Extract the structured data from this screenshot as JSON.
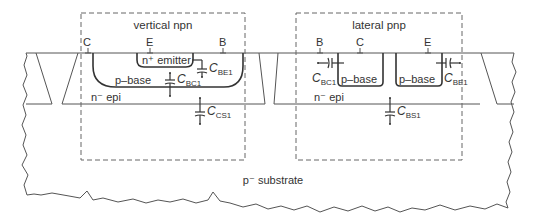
{
  "diagram": {
    "colors": {
      "line": "#555555",
      "junction": "#333333",
      "dash": "#666666",
      "text": "#333333",
      "background": "#ffffff"
    },
    "regions": {
      "substrate": "p⁻ substrate",
      "npn_epi": "n⁻ epi",
      "pnp_epi": "n⁻ epi"
    },
    "vertical_npn": {
      "box_label": "vertical npn",
      "terminals": {
        "collector": "C",
        "emitter": "E",
        "base": "B"
      },
      "emitter_region": "n⁺ emitter",
      "base_region": "p–base",
      "capacitors": [
        {
          "id": "cbe1",
          "symbol": "C",
          "subscript": "BE1"
        },
        {
          "id": "cbc1",
          "symbol": "C",
          "subscript": "BC1"
        },
        {
          "id": "ccs1",
          "symbol": "C",
          "subscript": "CS1"
        }
      ]
    },
    "lateral_pnp": {
      "box_label": "lateral pnp",
      "terminals": {
        "base": "B",
        "collector": "C",
        "emitter": "E"
      },
      "collector_region": "p–base",
      "emitter_region": "p–base",
      "capacitors": [
        {
          "id": "cbc1",
          "symbol": "C",
          "subscript": "BC1"
        },
        {
          "id": "cbe1",
          "symbol": "C",
          "subscript": "BE1"
        },
        {
          "id": "cbs1",
          "symbol": "C",
          "subscript": "BS1"
        }
      ]
    }
  }
}
